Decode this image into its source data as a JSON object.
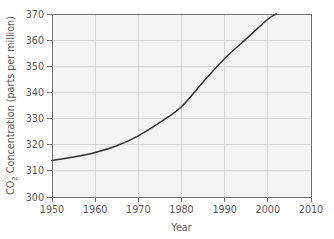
{
  "chart_data": {
    "type": "line",
    "title": "",
    "xlabel": "Year",
    "ylabel": "CO2 Concentration (parts per million)",
    "ylabel_main": "Concentration (parts per million)",
    "ylabel_prefix": "CO",
    "ylabel_subscript": "2",
    "xlim": [
      1950,
      2010
    ],
    "ylim": [
      300,
      370
    ],
    "grid": true,
    "legend": "none",
    "xticks": [
      1950,
      1960,
      1970,
      1980,
      1990,
      2000,
      2010
    ],
    "xtick_labels": [
      "1950",
      "1960",
      "1970",
      "1980",
      "1990",
      "2000",
      "2010"
    ],
    "yticks": [
      300,
      310,
      320,
      330,
      340,
      350,
      360,
      370
    ],
    "ytick_labels": [
      "300",
      "310",
      "320",
      "330",
      "340",
      "350",
      "360",
      "370"
    ],
    "series": [
      {
        "name": "CO2 concentration",
        "color": "#333333",
        "x": [
          1950,
          1955,
          1960,
          1965,
          1970,
          1975,
          1980,
          1985,
          1990,
          1995,
          2000,
          2002
        ],
        "values": [
          314.0,
          315.3,
          317.0,
          319.6,
          323.4,
          328.5,
          334.5,
          344.0,
          353.0,
          360.5,
          368.0,
          370.0
        ]
      }
    ]
  },
  "colors": {
    "plot_background": "#f4f4f4",
    "page_background": "#ffffff",
    "grid": "#c9c9c9",
    "axis": "#6e6e6e",
    "curve": "#333333",
    "text": "#58585a"
  }
}
